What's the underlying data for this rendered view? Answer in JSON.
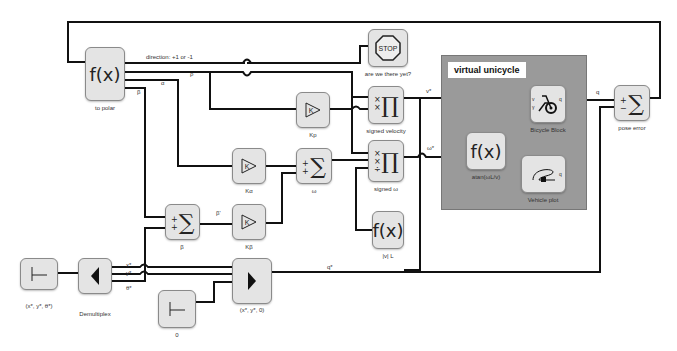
{
  "diagram": {
    "group": {
      "title": "virtual unicycle"
    },
    "blocks": {
      "to_polar": {
        "glyph": "f(x)",
        "label": "to polar"
      },
      "stop": {
        "glyph": "STOP",
        "label": "are we there yet?"
      },
      "kp": {
        "glyph": "K",
        "label": "Kp"
      },
      "signed_velocity": {
        "glyph": "∏",
        "signs": "×\n×",
        "label": "signed velocity"
      },
      "ka": {
        "glyph": "K",
        "label": "Kα"
      },
      "omega": {
        "glyph": "∑",
        "signs": "+\n+",
        "label": "ω"
      },
      "signed_omega": {
        "glyph": "∏",
        "signs": "×\n×\n÷",
        "label": "signed ω"
      },
      "beta_sum": {
        "glyph": "∑",
        "signs": "+\n+",
        "label": "β"
      },
      "kb": {
        "glyph": "K",
        "label": "Kβ"
      },
      "abs_l": {
        "glyph": "f(x)",
        "label": "|v| L"
      },
      "atan": {
        "glyph": "f(x)",
        "label": "atan(ωL/v)"
      },
      "bicycle": {
        "glyph": "bicycle",
        "ports": [
          "v",
          "γ"
        ],
        "out": "q",
        "label": "Bicycle Block"
      },
      "vehicle_plot": {
        "glyph": "vehicle-path",
        "in": "q",
        "label": "Vehicle plot"
      },
      "pose_error": {
        "glyph": "∑",
        "signs": "+\n−",
        "label": "pose error"
      },
      "const_xyt": {
        "glyph": "constant",
        "label": "(x*, y*, θ*)"
      },
      "demux": {
        "glyph": "demux",
        "label": "Demultiplex"
      },
      "const_zero": {
        "glyph": "constant",
        "label": "0"
      },
      "mux": {
        "glyph": "mux",
        "label": "(x*, y*, 0)"
      }
    },
    "wire_labels": {
      "direction": "direction: +1 or -1",
      "rho": "ρ",
      "alpha": "α",
      "beta": "β",
      "beta_star": "β'",
      "v_star": "v*",
      "omega_star": "ω*",
      "q": "q",
      "q_star": "q*",
      "x_star": "x*",
      "y_star": "y*",
      "theta_star": "θ*"
    }
  }
}
